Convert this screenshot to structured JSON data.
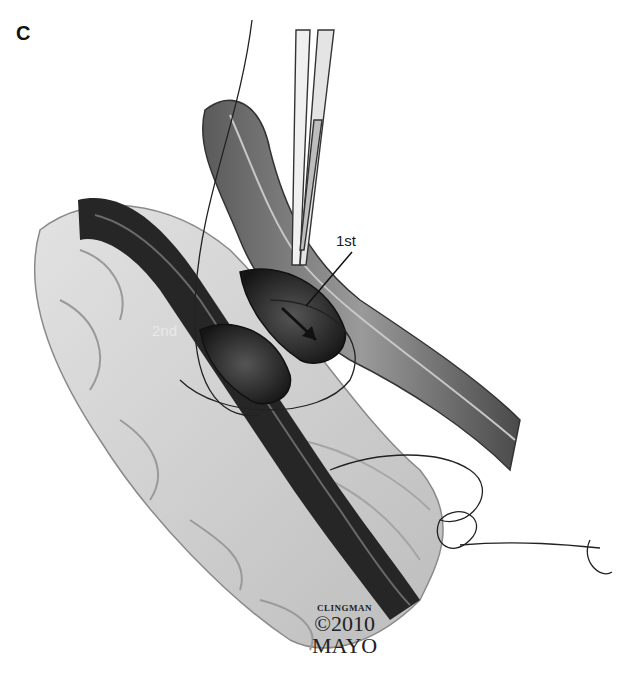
{
  "figure": {
    "panel_label": "C",
    "annotations": {
      "first": "1st",
      "second": "2nd"
    },
    "credit": {
      "line1": "CLINGMAN",
      "line2": "©2010",
      "line3": "MAYO"
    },
    "colors": {
      "background": "#ffffff",
      "tissue_light": "#d4d4d4",
      "vessel_dark": "#2a2a2a",
      "vessel_mid": "#7a7a7a",
      "suture": "#222222"
    }
  }
}
